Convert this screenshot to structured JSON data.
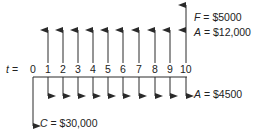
{
  "diagram": {
    "type": "cash-flow-diagram",
    "axis_label": "t",
    "axis_equals": "=",
    "periods": [
      "0",
      "1",
      "2",
      "3",
      "4",
      "5",
      "6",
      "7",
      "8",
      "9",
      "10"
    ],
    "colors": {
      "line": "#2a2a2a",
      "text": "#222222",
      "background": "#ffffff"
    },
    "labels": {
      "future_value": {
        "symbol": "F",
        "text": " = $5000"
      },
      "annual_income": {
        "symbol": "A",
        "text": " = $12,000"
      },
      "annual_cost": {
        "symbol": "A",
        "text": " = $4500"
      },
      "initial_cost": {
        "symbol": "C",
        "text": " = $30,000"
      }
    },
    "flows": {
      "initial_cost": {
        "period": 0,
        "direction": "down",
        "amount": 30000
      },
      "annual_income": {
        "periods": [
          1,
          2,
          3,
          4,
          5,
          6,
          7,
          8,
          9,
          10
        ],
        "direction": "up",
        "amount": 12000
      },
      "annual_cost": {
        "periods": [
          1,
          2,
          3,
          4,
          5,
          6,
          7,
          8,
          9,
          10
        ],
        "direction": "down",
        "amount": 4500
      },
      "future_value": {
        "period": 10,
        "direction": "up",
        "amount": 5000
      }
    }
  }
}
